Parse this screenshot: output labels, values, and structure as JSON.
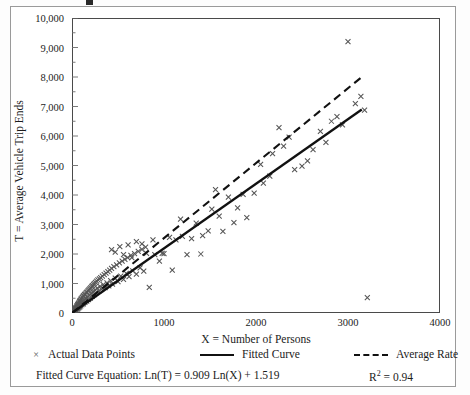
{
  "figure": {
    "title_fragment": "",
    "background": "#ffffff",
    "frame_color": "#9a9a9a"
  },
  "axes": {
    "y": {
      "title": "T = Average Vehicle Trip Ends",
      "ticks": [
        "10,000",
        "9,000",
        "8,000",
        "7,000",
        "6,000",
        "5,000",
        "4,000",
        "3,000",
        "2,000",
        "1,000",
        "0"
      ],
      "tick_values": [
        10000,
        9000,
        8000,
        7000,
        6000,
        5000,
        4000,
        3000,
        2000,
        1000,
        0
      ],
      "min": 0,
      "max": 10000,
      "minor_step": 500
    },
    "x": {
      "title": "X = Number of Persons",
      "ticks": [
        "0",
        "1000",
        "2000",
        "3000",
        "4000"
      ],
      "tick_values": [
        0,
        1000,
        2000,
        3000,
        4000
      ],
      "min": 0,
      "max": 4000,
      "minor_step": 500
    }
  },
  "legend": {
    "points_label": "Actual Data Points",
    "points_marker": "×",
    "fitted_label": "Fitted Curve",
    "average_label": "Average Rate"
  },
  "notes": {
    "equation": "Fitted Curve Equation: Ln(T) = 0.909 Ln(X) + 1.519",
    "r2_prefix": "R",
    "r2_sup": "2",
    "r2_value": " = 0.94"
  },
  "chart_data": {
    "type": "scatter",
    "title": "",
    "xlabel": "X = Number of Persons",
    "ylabel": "T = Average Vehicle Trip Ends",
    "xlim": [
      0,
      4000
    ],
    "ylim": [
      0,
      10000
    ],
    "grid": false,
    "legend_position": "below-axes",
    "series": [
      {
        "name": "Actual Data Points",
        "type": "scatter",
        "marker": "x",
        "color": "#555555",
        "points": [
          [
            15,
            40
          ],
          [
            20,
            60
          ],
          [
            22,
            95
          ],
          [
            28,
            70
          ],
          [
            30,
            110
          ],
          [
            33,
            130
          ],
          [
            35,
            80
          ],
          [
            38,
            150
          ],
          [
            40,
            120
          ],
          [
            42,
            175
          ],
          [
            45,
            95
          ],
          [
            48,
            200
          ],
          [
            50,
            160
          ],
          [
            52,
            230
          ],
          [
            55,
            135
          ],
          [
            58,
            250
          ],
          [
            60,
            190
          ],
          [
            62,
            280
          ],
          [
            65,
            150
          ],
          [
            68,
            300
          ],
          [
            70,
            220
          ],
          [
            72,
            330
          ],
          [
            75,
            180
          ],
          [
            78,
            350
          ],
          [
            80,
            260
          ],
          [
            82,
            390
          ],
          [
            85,
            210
          ],
          [
            88,
            410
          ],
          [
            90,
            300
          ],
          [
            92,
            440
          ],
          [
            95,
            245
          ],
          [
            98,
            470
          ],
          [
            100,
            330
          ],
          [
            104,
            500
          ],
          [
            108,
            280
          ],
          [
            112,
            530
          ],
          [
            116,
            380
          ],
          [
            120,
            560
          ],
          [
            124,
            310
          ],
          [
            128,
            590
          ],
          [
            132,
            430
          ],
          [
            136,
            620
          ],
          [
            140,
            360
          ],
          [
            145,
            650
          ],
          [
            150,
            480
          ],
          [
            155,
            690
          ],
          [
            160,
            400
          ],
          [
            165,
            720
          ],
          [
            170,
            540
          ],
          [
            175,
            760
          ],
          [
            180,
            450
          ],
          [
            185,
            790
          ],
          [
            190,
            600
          ],
          [
            195,
            830
          ],
          [
            200,
            500
          ],
          [
            205,
            860
          ],
          [
            210,
            660
          ],
          [
            215,
            900
          ],
          [
            220,
            560
          ],
          [
            225,
            930
          ],
          [
            230,
            720
          ],
          [
            235,
            970
          ],
          [
            240,
            620
          ],
          [
            245,
            1000
          ],
          [
            250,
            780
          ],
          [
            255,
            1040
          ],
          [
            260,
            680
          ],
          [
            268,
            1080
          ],
          [
            275,
            840
          ],
          [
            282,
            1120
          ],
          [
            290,
            740
          ],
          [
            298,
            1160
          ],
          [
            305,
            900
          ],
          [
            312,
            1200
          ],
          [
            320,
            800
          ],
          [
            330,
            1250
          ],
          [
            340,
            960
          ],
          [
            350,
            1300
          ],
          [
            360,
            860
          ],
          [
            370,
            1350
          ],
          [
            380,
            1020
          ],
          [
            390,
            1400
          ],
          [
            400,
            920
          ],
          [
            410,
            1450
          ],
          [
            420,
            1100
          ],
          [
            430,
            1510
          ],
          [
            440,
            980
          ],
          [
            455,
            1570
          ],
          [
            470,
            1180
          ],
          [
            485,
            1630
          ],
          [
            500,
            1060
          ],
          [
            515,
            1700
          ],
          [
            530,
            1250
          ],
          [
            545,
            1760
          ],
          [
            560,
            1140
          ],
          [
            575,
            1820
          ],
          [
            590,
            1340
          ],
          [
            605,
            1880
          ],
          [
            620,
            1230
          ],
          [
            640,
            1950
          ],
          [
            660,
            1430
          ],
          [
            680,
            2010
          ],
          [
            700,
            1320
          ],
          [
            720,
            2090
          ],
          [
            740,
            1530
          ],
          [
            760,
            2160
          ],
          [
            780,
            1420
          ],
          [
            800,
            2230
          ],
          [
            430,
            2150
          ],
          [
            470,
            2060
          ],
          [
            520,
            2250
          ],
          [
            560,
            1980
          ],
          [
            610,
            2310
          ],
          [
            650,
            1880
          ],
          [
            700,
            2420
          ],
          [
            760,
            2340
          ],
          [
            810,
            2020
          ],
          [
            840,
            870
          ],
          [
            880,
            2480
          ],
          [
            900,
            1980
          ],
          [
            950,
            1760
          ],
          [
            980,
            2020
          ],
          [
            1000,
            2010
          ],
          [
            1060,
            2560
          ],
          [
            1090,
            1450
          ],
          [
            1130,
            2480
          ],
          [
            1180,
            3180
          ],
          [
            1200,
            2600
          ],
          [
            1250,
            1980
          ],
          [
            1300,
            2520
          ],
          [
            1350,
            3050
          ],
          [
            1400,
            2000
          ],
          [
            1420,
            2620
          ],
          [
            1480,
            2780
          ],
          [
            1520,
            3520
          ],
          [
            1560,
            4180
          ],
          [
            1600,
            3280
          ],
          [
            1640,
            2770
          ],
          [
            1700,
            3930
          ],
          [
            1760,
            3060
          ],
          [
            1800,
            3560
          ],
          [
            1860,
            4020
          ],
          [
            1900,
            3230
          ],
          [
            1980,
            4060
          ],
          [
            2050,
            5040
          ],
          [
            2080,
            4400
          ],
          [
            2150,
            4640
          ],
          [
            2180,
            5400
          ],
          [
            2250,
            6280
          ],
          [
            2300,
            5660
          ],
          [
            2360,
            5960
          ],
          [
            2420,
            4860
          ],
          [
            2500,
            4980
          ],
          [
            2560,
            5160
          ],
          [
            2620,
            5540
          ],
          [
            2700,
            6160
          ],
          [
            2760,
            5780
          ],
          [
            2820,
            6500
          ],
          [
            2880,
            6660
          ],
          [
            2940,
            6380
          ],
          [
            3000,
            9200
          ],
          [
            3080,
            7100
          ],
          [
            3140,
            7340
          ],
          [
            3180,
            6880
          ],
          [
            3210,
            520
          ]
        ]
      },
      {
        "name": "Fitted Curve",
        "type": "line",
        "style": "solid",
        "color": "#111111",
        "equation": "Ln(T) = 0.909 Ln(X) + 1.519",
        "r_squared": 0.94,
        "endpoints": [
          [
            0,
            0
          ],
          [
            3150,
            6900
          ]
        ]
      },
      {
        "name": "Average Rate",
        "type": "line",
        "style": "dashed",
        "color": "#111111",
        "endpoints": [
          [
            0,
            0
          ],
          [
            3150,
            8000
          ]
        ]
      }
    ]
  }
}
